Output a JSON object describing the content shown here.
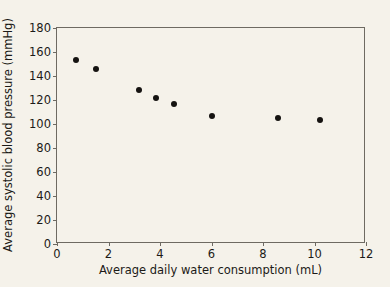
{
  "chart_data": {
    "type": "scatter",
    "title": "",
    "xlabel": "Average daily water consumption (mL)",
    "ylabel": "Average systolic blood pressure (mmHg)",
    "xlim": [
      0,
      12
    ],
    "ylim": [
      0,
      180
    ],
    "xticks": [
      0,
      2,
      4,
      6,
      8,
      10,
      12
    ],
    "yticks": [
      0,
      20,
      40,
      60,
      80,
      100,
      120,
      140,
      160,
      180
    ],
    "xtick_labels": [
      "0",
      "2",
      "4",
      "6",
      "8",
      "10",
      "12"
    ],
    "ytick_labels": [
      "0",
      "20",
      "40",
      "60",
      "80",
      "100",
      "120",
      "140",
      "160",
      "180"
    ],
    "grid": false,
    "legend": false,
    "marker": "filled-circle",
    "marker_color": "#151311",
    "background_color": "#f5f2ea",
    "axis_color": "#6e6a62",
    "series": [
      {
        "name": "Average systolic blood pressure",
        "points": [
          {
            "x": 0.75,
            "y": 153
          },
          {
            "x": 1.5,
            "y": 146
          },
          {
            "x": 3.2,
            "y": 128
          },
          {
            "x": 3.85,
            "y": 122
          },
          {
            "x": 4.55,
            "y": 117
          },
          {
            "x": 6.0,
            "y": 107
          },
          {
            "x": 8.6,
            "y": 105
          },
          {
            "x": 10.2,
            "y": 103
          }
        ]
      }
    ]
  }
}
